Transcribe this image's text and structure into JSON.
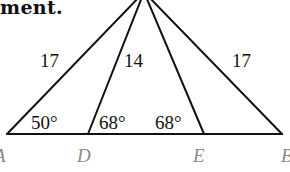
{
  "heading": "ment.",
  "figure": {
    "points": {
      "A": "A",
      "D": "D",
      "E": "E",
      "B": "B"
    },
    "side_labels": {
      "left": "17",
      "inner": "14",
      "right": "17"
    },
    "angles": {
      "A": "50°",
      "D": "68°",
      "E": "68°"
    },
    "colors": {
      "line": "#111111",
      "point_label": "#8a8a8a"
    }
  }
}
